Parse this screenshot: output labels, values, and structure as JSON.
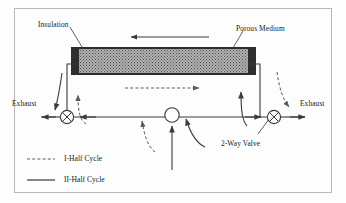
{
  "figure": {
    "background_color": "#fdfdfd",
    "frame_color": "#b9b9b9",
    "line_color": "#3a3a3a"
  },
  "labels": {
    "insulation": "Insulation",
    "porous_medium": "Porous Medium",
    "exhaust_left": "Exhaust",
    "exhaust_right": "Exhaust",
    "two_way_valve": "2-Way Valve"
  },
  "legend": {
    "items": [
      {
        "label": "I-Half Cycle",
        "style": "dashed"
      },
      {
        "label": "II-Half Cycle",
        "style": "solid"
      }
    ]
  },
  "components": {
    "porous_medium": {
      "name": "porous-medium-bed",
      "fill": "#b4b4b4",
      "texture": "stippled"
    },
    "insulation_caps": {
      "name": "insulation-end-caps",
      "fill": "#2e2e2e",
      "count": 2
    },
    "valves": [
      {
        "name": "left-two-way-valve",
        "symbol": "circle-with-cross"
      },
      {
        "name": "right-two-way-valve",
        "symbol": "circle-with-cross"
      },
      {
        "name": "center-junction",
        "symbol": "open-circle"
      }
    ]
  },
  "flows": {
    "top_arrow_direction": "left",
    "top_arrow_style": "solid",
    "mid_arrow_direction": "right",
    "mid_arrow_style": "dashed"
  }
}
